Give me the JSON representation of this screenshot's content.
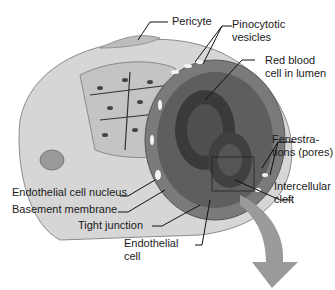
{
  "diagram": {
    "labels": {
      "pericyte": "Pericyte",
      "pinocytotic_1": "Pinocytotic",
      "pinocytotic_2": "vesicles",
      "rbc_1": "Red blood",
      "rbc_2": "cell in lumen",
      "fen_1": "Fenestra-",
      "fen_2": "tions (pores)",
      "cleft_1": "Intercellular",
      "cleft_2": "cleft",
      "nucleus": "Endothelial cell nucleus",
      "basement": "Basement membrane",
      "tight": "Tight junction",
      "endo_1": "Endothelial",
      "endo_2": "cell"
    },
    "colors": {
      "vessel_light": "#d6d6d6",
      "vessel_mid": "#a8a8a8",
      "lumen_dark": "#6e6e6e",
      "rbc": "#4a4a4a",
      "arrow": "#9a9a9a"
    }
  }
}
